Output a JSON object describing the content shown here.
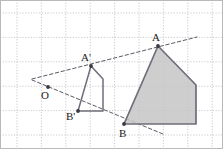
{
  "figure": {
    "width": 223,
    "height": 149,
    "background_color": "#ffffff",
    "border_color": "#b9b9b9"
  },
  "grid": {
    "visible": true,
    "style": "dotted",
    "color": "#c9c9d2",
    "spacing_px": 24.4,
    "x_lines": [
      17,
      41.4,
      65.8,
      90.2,
      114.6,
      139,
      163.4,
      187.8,
      212.2
    ],
    "y_lines": [
      13,
      37.4,
      61.8,
      86.2,
      110.6,
      135
    ]
  },
  "labels": {
    "center": "O",
    "small_apex": "A'",
    "small_base": "B'",
    "large_apex": "A",
    "large_base": "B"
  },
  "points": {
    "O": {
      "x": 48,
      "y": 87,
      "label": "O",
      "label_x": 41,
      "label_y": 99,
      "marker": true
    },
    "Ap": {
      "x": 91,
      "y": 66,
      "label": "A'",
      "label_x": 81,
      "label_y": 61,
      "marker": true
    },
    "Bp": {
      "x": 78,
      "y": 111,
      "label": "B'",
      "label_x": 66,
      "label_y": 120,
      "marker": true
    },
    "A": {
      "x": 158,
      "y": 46,
      "label": "A",
      "label_x": 152,
      "label_y": 41,
      "marker": true
    },
    "B": {
      "x": 124,
      "y": 124,
      "label": "B",
      "label_x": 119,
      "label_y": 137,
      "marker": true
    }
  },
  "shapes": {
    "small_pentagon": {
      "name": "preimage-pentagon",
      "points": "91,66 103,79 103,111 78,111",
      "fill": "none",
      "stroke": "#6e6e78",
      "stroke_width": 1.5
    },
    "large_pentagon": {
      "name": "image-pentagon",
      "points": "158,46 196,85 196,124 124,124",
      "fill": "#c6c6c6",
      "fill_opacity": 0.85,
      "stroke": "#6e6e78",
      "stroke_width": 1.7
    }
  },
  "rays": {
    "stroke": "#5a5a64",
    "stroke_width": 1,
    "dash": "3.5,2.5",
    "upper": {
      "name": "ray-through-A",
      "x1": 32,
      "y1": 79,
      "x2": 197,
      "y2": 37
    },
    "lower": {
      "name": "ray-through-B",
      "x1": 32,
      "y1": 80,
      "x2": 163,
      "y2": 134
    }
  }
}
